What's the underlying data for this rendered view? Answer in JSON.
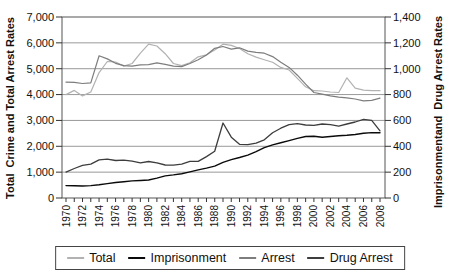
{
  "figure": {
    "background": "#ffffff",
    "left_axis_title": "Total  Crime and Total Arrest Rates",
    "right_axis_title": "Imprisonmentand  Drug Arrest Rates"
  },
  "legend": {
    "items": [
      {
        "label": "Total",
        "color": "#b2b2b2"
      },
      {
        "label": "Imprisonment",
        "color": "#0a0a0a"
      },
      {
        "label": "Arrest",
        "color": "#7d7d7d"
      },
      {
        "label": "Drug Arrest",
        "color": "#3d3d3d"
      }
    ]
  },
  "chart_data": {
    "type": "line",
    "grid": true,
    "legend_position": "bottom",
    "x_years": [
      1970,
      1971,
      1972,
      1973,
      1974,
      1975,
      1976,
      1977,
      1978,
      1979,
      1980,
      1981,
      1982,
      1983,
      1984,
      1985,
      1986,
      1987,
      1988,
      1989,
      1990,
      1991,
      1992,
      1993,
      1994,
      1995,
      1996,
      1997,
      1998,
      1999,
      2000,
      2001,
      2002,
      2003,
      2004,
      2005,
      2006,
      2007,
      2008
    ],
    "x_tick_labels": [
      "1970",
      "1972",
      "1974",
      "1976",
      "1978",
      "1980",
      "1982",
      "1984",
      "1986",
      "1988",
      "1990",
      "1992",
      "1994",
      "1996",
      "1998",
      "2000",
      "2002",
      "2004",
      "2006",
      "2008"
    ],
    "left_axis": {
      "title": "Total  Crime and Total Arrest Rates",
      "range": [
        0,
        7000
      ],
      "tick_values": [
        0,
        1000,
        2000,
        3000,
        4000,
        5000,
        6000,
        7000
      ],
      "tick_labels": [
        "0",
        "1,000",
        "2,000",
        "3,000",
        "4,000",
        "5,000",
        "6,000",
        "7,000"
      ]
    },
    "right_axis": {
      "title": "Imprisonmentand  Drug Arrest Rates",
      "range": [
        0,
        1400
      ],
      "tick_values": [
        0,
        200,
        400,
        600,
        800,
        1000,
        1200,
        1400
      ],
      "tick_labels": [
        "0",
        "200",
        "400",
        "600",
        "800",
        "1,000",
        "1,200",
        "1,400"
      ]
    },
    "series": [
      {
        "name": "Total",
        "axis": "left",
        "color": "#b2b2b2",
        "width": 1.2,
        "values": [
          4000,
          4160,
          3950,
          4100,
          4850,
          5280,
          5260,
          5100,
          5200,
          5600,
          5950,
          5880,
          5580,
          5200,
          5120,
          5230,
          5460,
          5540,
          5720,
          5950,
          5900,
          5780,
          5580,
          5450,
          5350,
          5250,
          5050,
          4950,
          4630,
          4300,
          4150,
          4140,
          4100,
          4080,
          4650,
          4250,
          4170,
          4150,
          4150
        ]
      },
      {
        "name": "Arrest",
        "axis": "left",
        "color": "#7d7d7d",
        "width": 1.2,
        "values": [
          4480,
          4470,
          4430,
          4450,
          5500,
          5380,
          5210,
          5120,
          5100,
          5150,
          5160,
          5230,
          5170,
          5100,
          5080,
          5200,
          5350,
          5530,
          5790,
          5860,
          5760,
          5810,
          5680,
          5630,
          5600,
          5470,
          5250,
          5050,
          4750,
          4400,
          4080,
          4020,
          3950,
          3900,
          3870,
          3830,
          3760,
          3780,
          3860
        ]
      },
      {
        "name": "Drug Arrest",
        "axis": "right",
        "color": "#3d3d3d",
        "width": 1.3,
        "values": [
          200,
          228,
          252,
          262,
          295,
          300,
          290,
          293,
          285,
          272,
          282,
          272,
          255,
          254,
          262,
          284,
          283,
          320,
          362,
          580,
          470,
          415,
          412,
          425,
          450,
          505,
          540,
          568,
          575,
          565,
          562,
          572,
          567,
          555,
          572,
          588,
          608,
          600,
          520
        ]
      },
      {
        "name": "Imprisonment",
        "axis": "right",
        "color": "#0a0a0a",
        "width": 1.4,
        "values": [
          96,
          95,
          93,
          96,
          102,
          111,
          120,
          126,
          132,
          135,
          139,
          154,
          171,
          179,
          188,
          202,
          217,
          231,
          247,
          276,
          297,
          313,
          332,
          359,
          389,
          411,
          427,
          444,
          461,
          476,
          478,
          470,
          476,
          482,
          486,
          491,
          501,
          506,
          504
        ]
      }
    ]
  }
}
